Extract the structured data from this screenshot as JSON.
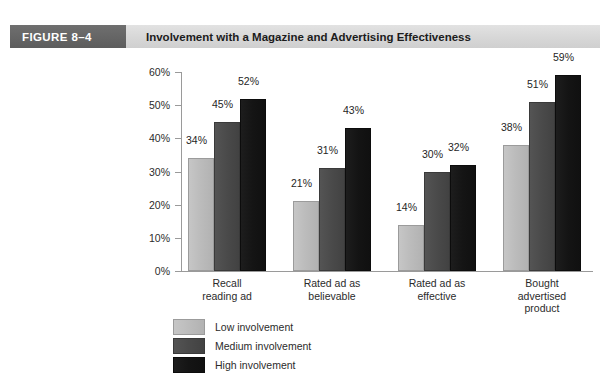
{
  "header": {
    "badge": "FIGURE  8–4",
    "title": "Involvement with a Magazine and Advertising Effectiveness"
  },
  "chart_data": {
    "type": "bar",
    "title": "Involvement with a Magazine and Advertising Effectiveness",
    "xlabel": "",
    "ylabel": "",
    "ylim": [
      0,
      60
    ],
    "grid": false,
    "legend_position": "bottom-left",
    "ytick_labels": [
      "60%",
      "50%",
      "40%",
      "30%",
      "20%",
      "10%",
      "0%"
    ],
    "yticks": [
      60,
      50,
      40,
      30,
      20,
      10,
      0
    ],
    "categories": [
      "Recall\nreading ad",
      "Rated ad as\nbelievable",
      "Rated ad as\neffective",
      "Bought\nadvertised\nproduct"
    ],
    "category_lines": [
      [
        "Recall",
        "reading ad"
      ],
      [
        "Rated ad as",
        "believable"
      ],
      [
        "Rated ad as",
        "effective"
      ],
      [
        "Bought",
        "advertised",
        "product"
      ]
    ],
    "series": [
      {
        "name": "Low involvement",
        "color": "#bcbcbc",
        "values": [
          34,
          21,
          14,
          38
        ],
        "labels": [
          "34%",
          "21%",
          "14%",
          "38%"
        ]
      },
      {
        "name": "Medium involvement",
        "color": "#4a4a4a",
        "values": [
          45,
          31,
          30,
          51
        ],
        "labels": [
          "45%",
          "31%",
          "30%",
          "51%"
        ]
      },
      {
        "name": "High involvement",
        "color": "#141414",
        "values": [
          52,
          43,
          32,
          59
        ],
        "labels": [
          "52%",
          "43%",
          "32%",
          "59%"
        ]
      }
    ]
  },
  "legend": {
    "items": [
      {
        "label": "Low involvement"
      },
      {
        "label": "Medium involvement"
      },
      {
        "label": "High involvement"
      }
    ]
  }
}
